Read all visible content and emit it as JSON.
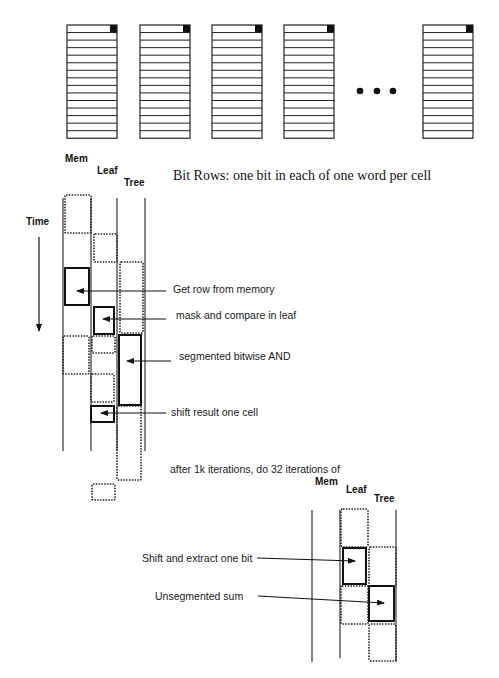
{
  "word_stacks": {
    "count_shown": 5,
    "rows_per_stack": 15,
    "ellipsis": "• • •",
    "caption": "Bit Rows: one bit in each of one word per cell"
  },
  "columns": {
    "mem": "Mem",
    "leaf": "Leaf",
    "tree": "Tree"
  },
  "timeline": {
    "time_label": "Time",
    "annotations": [
      "Get row from memory",
      "mask and compare in leaf",
      "segmented bitwise AND",
      "shift result one cell"
    ],
    "transition_text": "after 1k iterations, do 32 iterations of"
  },
  "second_timeline": {
    "columns": {
      "mem": "Mem",
      "leaf": "Leaf",
      "tree": "Tree"
    },
    "annotations": [
      "Shift and extract one bit",
      "Unsegmented sum"
    ]
  },
  "colors": {
    "ink": "#111111",
    "background": "#ffffff"
  }
}
